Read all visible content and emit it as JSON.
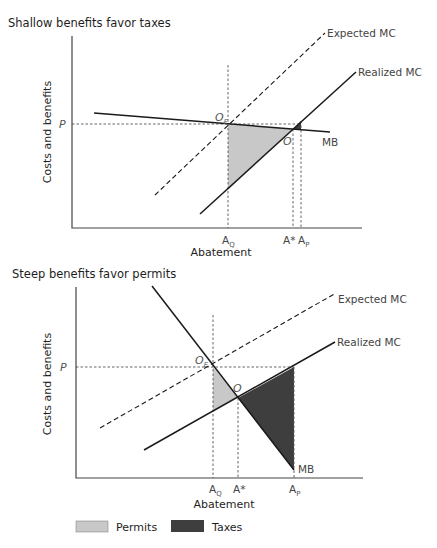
{
  "colors": {
    "permits_fill": "#c8c8c8",
    "taxes_fill": "#3e3e3e",
    "line": "#1a1a1a"
  },
  "top_panel": {
    "title": "Shallow benefits favor taxes",
    "y_axis_label": "Costs and benefits",
    "x_axis_label": "Abatement",
    "price_label": "P",
    "curves": {
      "expected_mc": "Expected MC",
      "realized_mc": "Realized MC",
      "mb": "MB"
    },
    "points": {
      "oe": "O",
      "oe_sub": "E",
      "o": "O"
    },
    "x_ticks": {
      "aq": "A",
      "aq_sub": "Q",
      "astar": "A*",
      "ap": "A",
      "ap_sub": "P"
    }
  },
  "bottom_panel": {
    "title": "Steep benefits favor permits",
    "y_axis_label": "Costs and benefits",
    "x_axis_label": "Abatement",
    "price_label": "P",
    "curves": {
      "expected_mc": "Expected MC",
      "realized_mc": "Realized MC",
      "mb": "MB"
    },
    "points": {
      "oe": "O",
      "oe_sub": "E",
      "o": "O"
    },
    "x_ticks": {
      "aq": "A",
      "aq_sub": "Q",
      "astar": "A*",
      "ap": "A",
      "ap_sub": "P"
    }
  },
  "legend": {
    "permits": "Permits",
    "taxes": "Taxes"
  }
}
